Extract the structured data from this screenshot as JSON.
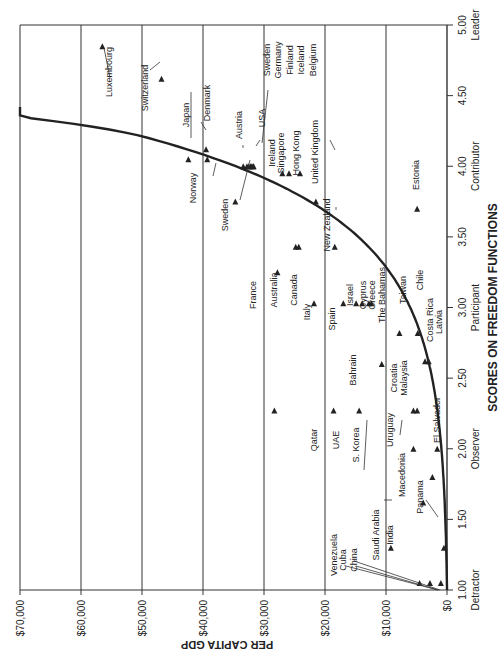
{
  "chart_data": {
    "type": "scatter",
    "orientation": "rotated-90-ccw",
    "title": "",
    "xlabel": "SCORES ON FREEDOM FUNCTIONS",
    "ylabel": "PER CAPITA GDP",
    "xlim": [
      1.0,
      5.0
    ],
    "ylim": [
      0,
      70000
    ],
    "x_ticks": [
      {
        "value": 1.0,
        "label": "1.00",
        "sublabel": "Detractor"
      },
      {
        "value": 1.5,
        "label": "1.50",
        "sublabel": ""
      },
      {
        "value": 2.0,
        "label": "2.00",
        "sublabel": "Observer"
      },
      {
        "value": 2.5,
        "label": "2.50",
        "sublabel": ""
      },
      {
        "value": 3.0,
        "label": "3.00",
        "sublabel": "Participant"
      },
      {
        "value": 3.5,
        "label": "3.50",
        "sublabel": ""
      },
      {
        "value": 4.0,
        "label": "4.00",
        "sublabel": "Contributor"
      },
      {
        "value": 4.5,
        "label": "4.50",
        "sublabel": ""
      },
      {
        "value": 5.0,
        "label": "5.00",
        "sublabel": "Leader"
      }
    ],
    "y_ticks": [
      {
        "value": 0,
        "label": "$0"
      },
      {
        "value": 10000,
        "label": "$10,000"
      },
      {
        "value": 20000,
        "label": "$20,000"
      },
      {
        "value": 30000,
        "label": "$30,000"
      },
      {
        "value": 40000,
        "label": "$40,000"
      },
      {
        "value": 50000,
        "label": "$50,000"
      },
      {
        "value": 60000,
        "label": "$60,000"
      },
      {
        "value": 70000,
        "label": "$70,000"
      }
    ],
    "grid": {
      "horizontal_gdp_lines": true,
      "vertical": false
    },
    "trend_curve": {
      "type": "exponential",
      "description": "Curve rising from ~$0 at 1.00 to ~$64,000 at 4.40",
      "points": [
        [
          1.0,
          0
        ],
        [
          1.5,
          600
        ],
        [
          2.0,
          2000
        ],
        [
          2.5,
          5500
        ],
        [
          3.0,
          11500
        ],
        [
          3.5,
          20500
        ],
        [
          3.75,
          27000
        ],
        [
          4.0,
          34500
        ],
        [
          4.25,
          46000
        ],
        [
          4.4,
          64000
        ]
      ]
    },
    "series": [
      {
        "name": "Countries",
        "points": [
          {
            "label": "Luxembourg",
            "x": 4.85,
            "y": 56500
          },
          {
            "label": "Switzerland",
            "x": 4.62,
            "y": 46800
          },
          {
            "label": "Japan",
            "x": 4.05,
            "y": 42400
          },
          {
            "label": "Denmark",
            "x": 4.12,
            "y": 39500
          },
          {
            "label": "Norway",
            "x": 4.05,
            "y": 39300
          },
          {
            "label": "Austria",
            "x": 4.0,
            "y": 33400
          },
          {
            "label": "USA",
            "x": 4.0,
            "y": 31700
          },
          {
            "label": "Sweden",
            "x": 3.75,
            "y": 34700
          },
          {
            "label": "Sweden (group)",
            "x": 4.0,
            "y": 32800
          },
          {
            "label": "Germany",
            "x": 4.0,
            "y": 32500
          },
          {
            "label": "Finland",
            "x": 4.0,
            "y": 32200
          },
          {
            "label": "Iceland",
            "x": 4.0,
            "y": 32000
          },
          {
            "label": "Belgium",
            "x": 4.0,
            "y": 31800
          },
          {
            "label": "Ireland",
            "x": 3.95,
            "y": 27000
          },
          {
            "label": "Singapore",
            "x": 3.95,
            "y": 25900
          },
          {
            "label": "Hong Kong",
            "x": 3.95,
            "y": 24100
          },
          {
            "label": "United Kingdom",
            "x": 3.75,
            "y": 21500
          },
          {
            "label": "New Zealand",
            "x": 3.43,
            "y": 18400
          },
          {
            "label": "France",
            "x": 3.25,
            "y": 27800
          },
          {
            "label": "Australia",
            "x": 3.43,
            "y": 24800
          },
          {
            "label": "Canada",
            "x": 3.43,
            "y": 24300
          },
          {
            "label": "Italy",
            "x": 3.03,
            "y": 21800
          },
          {
            "label": "Spain",
            "x": 3.03,
            "y": 17000
          },
          {
            "label": "Israel",
            "x": 3.03,
            "y": 14900
          },
          {
            "label": "Cyprus",
            "x": 3.03,
            "y": 13900
          },
          {
            "label": "Greece",
            "x": 3.03,
            "y": 12800
          },
          {
            "label": "The Bahamas",
            "x": 3.03,
            "y": 12400
          },
          {
            "label": "Taiwan",
            "x": 2.82,
            "y": 7800
          },
          {
            "label": "Chile",
            "x": 2.82,
            "y": 4800
          },
          {
            "label": "Estonia",
            "x": 3.7,
            "y": 4900
          },
          {
            "label": "Costa Rica",
            "x": 2.62,
            "y": 3600
          },
          {
            "label": "Latvia",
            "x": 2.62,
            "y": 3000
          },
          {
            "label": "Bahrain",
            "x": 2.6,
            "y": 10700
          },
          {
            "label": "Qatar",
            "x": 2.27,
            "y": 28300
          },
          {
            "label": "UAE",
            "x": 2.27,
            "y": 18600
          },
          {
            "label": "S. Korea",
            "x": 2.27,
            "y": 14400
          },
          {
            "label": "Malaysia",
            "x": 2.27,
            "y": 4900
          },
          {
            "label": "Croatia",
            "x": 2.27,
            "y": 5500
          },
          {
            "label": "Uruguay",
            "x": 2.0,
            "y": 5500
          },
          {
            "label": "El Salvador",
            "x": 2.0,
            "y": 1600
          },
          {
            "label": "Macedonia",
            "x": 1.8,
            "y": 2400
          },
          {
            "label": "Panama",
            "x": 1.62,
            "y": 3900
          },
          {
            "label": "Saudi Arabia",
            "x": 1.3,
            "y": 9200
          },
          {
            "label": "India",
            "x": 1.3,
            "y": 500
          },
          {
            "label": "Venezuela",
            "x": 1.05,
            "y": 4500
          },
          {
            "label": "Cuba",
            "x": 1.05,
            "y": 2800
          },
          {
            "label": "China",
            "x": 1.05,
            "y": 1000
          }
        ]
      }
    ]
  },
  "axes": {
    "ylabel": "PER CAPITA GDP",
    "xlabel": "SCORES ON FREEDOM FUNCTIONS"
  }
}
